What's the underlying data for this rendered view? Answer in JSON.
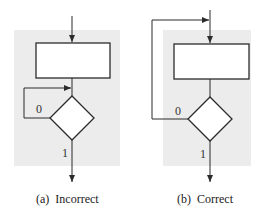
{
  "colors": {
    "background": "#ffffff",
    "panel_fill": "#ececec",
    "stroke": "#2b2b2b"
  },
  "panels": [
    {
      "id": "a",
      "caption": "(a)  Incorrect",
      "branch_false_label": "0",
      "branch_true_label": "1",
      "feedback_target": "between process box and decision"
    },
    {
      "id": "b",
      "caption": "(b)  Correct",
      "branch_false_label": "0",
      "branch_true_label": "1",
      "feedback_target": "before process box"
    }
  ]
}
